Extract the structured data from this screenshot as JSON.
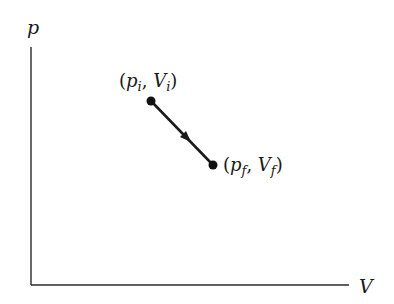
{
  "diagram": {
    "type": "pV-diagram",
    "axes": {
      "y_label": "p",
      "x_label": "V"
    },
    "points": [
      {
        "name": "initial",
        "label_open": "(",
        "var1": "p",
        "sub1": "i",
        "sep": ", ",
        "var2": "V",
        "sub2": "i",
        "label_close": ")"
      },
      {
        "name": "final",
        "label_open": "(",
        "var1": "p",
        "sub1": "f",
        "sep": ", ",
        "var2": "V",
        "sub2": "f",
        "label_close": ")"
      }
    ],
    "process": {
      "from": "initial",
      "to": "final",
      "direction": "arrow from (pi, Vi) to (pf, Vf)"
    },
    "colors": {
      "line": "#1a1a1a",
      "background": "#ffffff"
    }
  }
}
